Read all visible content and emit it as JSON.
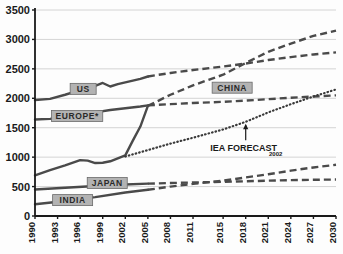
{
  "chart_data": {
    "type": "line",
    "title": "",
    "xlabel": "",
    "ylabel": "",
    "xlim": [
      1990,
      2030
    ],
    "ylim": [
      0,
      3500
    ],
    "grid": true,
    "legend_position": "inline-labels",
    "y_ticks": [
      "0",
      "500",
      "1000",
      "1500",
      "2000",
      "2500",
      "3000",
      "3500"
    ],
    "x_ticks": [
      "1990",
      "1993",
      "1996",
      "1999",
      "2002",
      "2005",
      "2008",
      "2011",
      "2015",
      "2018",
      "2021",
      "2024",
      "2027",
      "2030"
    ],
    "annotations": [
      {
        "id": "iea-forecast",
        "text": "IEA FORECAST",
        "subscript": "2002",
        "points_to_series": "IEA FORECAST 2002",
        "x": 2018,
        "y": 1560
      }
    ],
    "series": [
      {
        "name": "US",
        "label": "US",
        "style": "solid-then-dashed",
        "color": "#4a4a4a",
        "solid_x": [
          1990,
          1992,
          1994,
          1996,
          1998,
          1999,
          2000,
          2001,
          2002,
          2003,
          2004,
          2005
        ],
        "solid_y": [
          1970,
          1990,
          2060,
          2140,
          2210,
          2260,
          2200,
          2240,
          2270,
          2300,
          2330,
          2370
        ],
        "dashed_x": [
          2005,
          2008,
          2011,
          2015,
          2018,
          2021,
          2024,
          2027,
          2030
        ],
        "dashed_y": [
          2370,
          2430,
          2480,
          2540,
          2590,
          2650,
          2700,
          2745,
          2780
        ]
      },
      {
        "name": "EUROPE*",
        "label": "EUROPE*",
        "style": "solid-then-dashed",
        "color": "#4a4a4a",
        "solid_x": [
          1990,
          1992,
          1994,
          1996,
          1998,
          2000,
          2002,
          2004,
          2005
        ],
        "solid_y": [
          1640,
          1650,
          1680,
          1720,
          1760,
          1800,
          1830,
          1860,
          1880
        ],
        "dashed_x": [
          2005,
          2008,
          2011,
          2015,
          2018,
          2021,
          2024,
          2027,
          2030
        ],
        "dashed_y": [
          1880,
          1900,
          1920,
          1940,
          1960,
          1985,
          2010,
          2030,
          2050
        ]
      },
      {
        "name": "CHINA",
        "label": "CHINA",
        "style": "solid-then-dashed",
        "color": "#4a4a4a",
        "solid_x": [
          1990,
          1992,
          1994,
          1996,
          1997,
          1998,
          1999,
          2000,
          2001,
          2002,
          2003,
          2004,
          2005
        ],
        "solid_y": [
          690,
          780,
          860,
          950,
          940,
          900,
          905,
          930,
          980,
          1030,
          1280,
          1520,
          1870
        ],
        "dashed_x": [
          2005,
          2008,
          2011,
          2015,
          2018,
          2021,
          2024,
          2027,
          2030
        ],
        "dashed_y": [
          1870,
          2060,
          2220,
          2400,
          2600,
          2790,
          2930,
          3060,
          3150
        ]
      },
      {
        "name": "JAPAN",
        "label": "JAPAN",
        "style": "solid-then-dashed",
        "color": "#4a4a4a",
        "solid_x": [
          1990,
          1994,
          1998,
          2002,
          2005
        ],
        "solid_y": [
          450,
          480,
          510,
          535,
          550
        ],
        "dashed_x": [
          2005,
          2008,
          2011,
          2015,
          2018,
          2021,
          2024,
          2027,
          2030
        ],
        "dashed_y": [
          550,
          560,
          570,
          580,
          590,
          600,
          610,
          615,
          620
        ]
      },
      {
        "name": "INDIA",
        "label": "INDIA",
        "style": "solid-then-dashed",
        "color": "#4a4a4a",
        "solid_x": [
          1990,
          1994,
          1998,
          2002,
          2005
        ],
        "solid_y": [
          200,
          255,
          320,
          400,
          445
        ],
        "dashed_x": [
          2005,
          2008,
          2011,
          2015,
          2018,
          2021,
          2024,
          2027,
          2030
        ],
        "dashed_y": [
          445,
          500,
          545,
          600,
          655,
          710,
          770,
          825,
          870
        ]
      },
      {
        "name": "IEA FORECAST 2002",
        "label": "IEA FORECAST",
        "style": "dotted",
        "color": "#3a3a3a",
        "dotted_x": [
          2002,
          2005,
          2008,
          2011,
          2015,
          2018,
          2021,
          2024,
          2027,
          2030
        ],
        "dotted_y": [
          1010,
          1120,
          1230,
          1330,
          1470,
          1600,
          1760,
          1900,
          2030,
          2150
        ]
      }
    ],
    "series_box_labels": [
      {
        "name": "US",
        "x": 1996.4,
        "y": 2160
      },
      {
        "name": "EUROPE*",
        "x": 1995.6,
        "y": 1700
      },
      {
        "name": "CHINA",
        "x": 2016.2,
        "y": 2180
      },
      {
        "name": "JAPAN",
        "x": 1999.6,
        "y": 560
      },
      {
        "name": "INDIA",
        "x": 1995.0,
        "y": 270
      }
    ],
    "colors": {
      "line": "#4a4a4a",
      "grid": "#c9c9c9",
      "axis": "#1a1a1a",
      "label_box_fill": "#b3b3b3",
      "label_box_border": "#6a6a6a",
      "background": "#fdfdfd"
    }
  }
}
